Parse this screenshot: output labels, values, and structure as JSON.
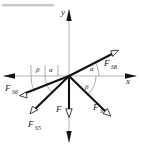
{
  "figure": {
    "origin_label": "O",
    "background_color": "#ffffff",
    "force_color": "#121212",
    "axis_color": "#b9b9b9"
  },
  "axes": {
    "x": {
      "label": "x",
      "label_x": 126,
      "label_y": 82,
      "has_left_arrow": true,
      "has_right_arrow": true
    },
    "y": {
      "label": "y",
      "label_x": 61,
      "label_y": 15,
      "has_top_arrow": true,
      "has_bottom_arrow": true
    }
  },
  "vectors": [
    {
      "name": "F_S8",
      "base": "F",
      "subscript": "S8",
      "label_x": 104,
      "label_y": 66,
      "sub_x": 111,
      "sub_y": 69,
      "tip_x": 117,
      "tip_y": 50,
      "direction": "upper-right",
      "angle_label": "alpha"
    },
    {
      "name": "F_S7",
      "base": "F",
      "subscript": "S7",
      "label_x": 93,
      "label_y": 110,
      "sub_x": 100,
      "sub_y": 113,
      "tip_x": 110,
      "tip_y": 115,
      "direction": "lower-right",
      "angle_label": "beta"
    },
    {
      "name": "F_S6",
      "base": "F",
      "subscript": "S6",
      "label_x": 6,
      "label_y": 91,
      "sub_x": 13,
      "sub_y": 94,
      "tip_x": 20,
      "tip_y": 96,
      "direction": "lower-left-shallow",
      "angle_label": "beta"
    },
    {
      "name": "F_S5",
      "base": "F",
      "subscript": "S5",
      "label_x": 29,
      "label_y": 127,
      "sub_x": 36,
      "sub_y": 130,
      "tip_x": 31,
      "tip_y": 113,
      "direction": "lower-left-steep",
      "angle_label": "alpha"
    },
    {
      "name": "F",
      "base": "F",
      "subscript": "",
      "label_x": 57,
      "label_y": 112,
      "sub_x": 0,
      "sub_y": 0,
      "tip_x": 69,
      "tip_y": 116,
      "direction": "down",
      "angle_label": ""
    }
  ],
  "angles": [
    {
      "id": "alpha-right",
      "symbol": "α",
      "label_x": 92,
      "label_y": 70,
      "side": "upper-right"
    },
    {
      "id": "beta-right",
      "symbol": "β",
      "label_x": 86,
      "label_y": 87,
      "side": "lower-right"
    },
    {
      "id": "alpha-left",
      "symbol": "α",
      "label_x": 50,
      "label_y": 72,
      "side": "upper-left"
    },
    {
      "id": "beta-left",
      "symbol": "β",
      "label_x": 37,
      "label_y": 72,
      "side": "lower-left"
    }
  ],
  "origin": {
    "x": 69,
    "y": 76
  }
}
